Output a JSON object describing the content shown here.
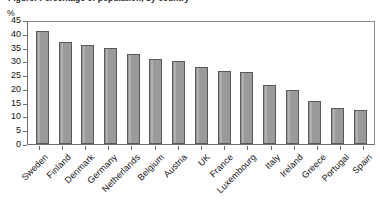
{
  "chart_data": {
    "type": "bar",
    "title": "Figure: Percentage of population, by country",
    "xlabel": "",
    "ylabel": "%",
    "ylim": [
      0,
      45
    ],
    "yticks": [
      0,
      5,
      10,
      15,
      20,
      25,
      30,
      35,
      40,
      45
    ],
    "grid": false,
    "legend": false,
    "bar_color": "#9a9a9a",
    "bar_border_color": "#59595c",
    "categories": [
      "Sweden",
      "Finland",
      "Denmark",
      "Germany",
      "Netherlands",
      "Belgium",
      "Austria",
      "UK",
      "France",
      "Luxembourg",
      "Italy",
      "Ireland",
      "Greece",
      "Portugal",
      "Spain"
    ],
    "values": [
      41,
      37,
      36,
      35,
      32.5,
      31,
      30,
      28,
      26.5,
      26,
      21.5,
      19.5,
      15.5,
      13,
      12.5
    ]
  }
}
